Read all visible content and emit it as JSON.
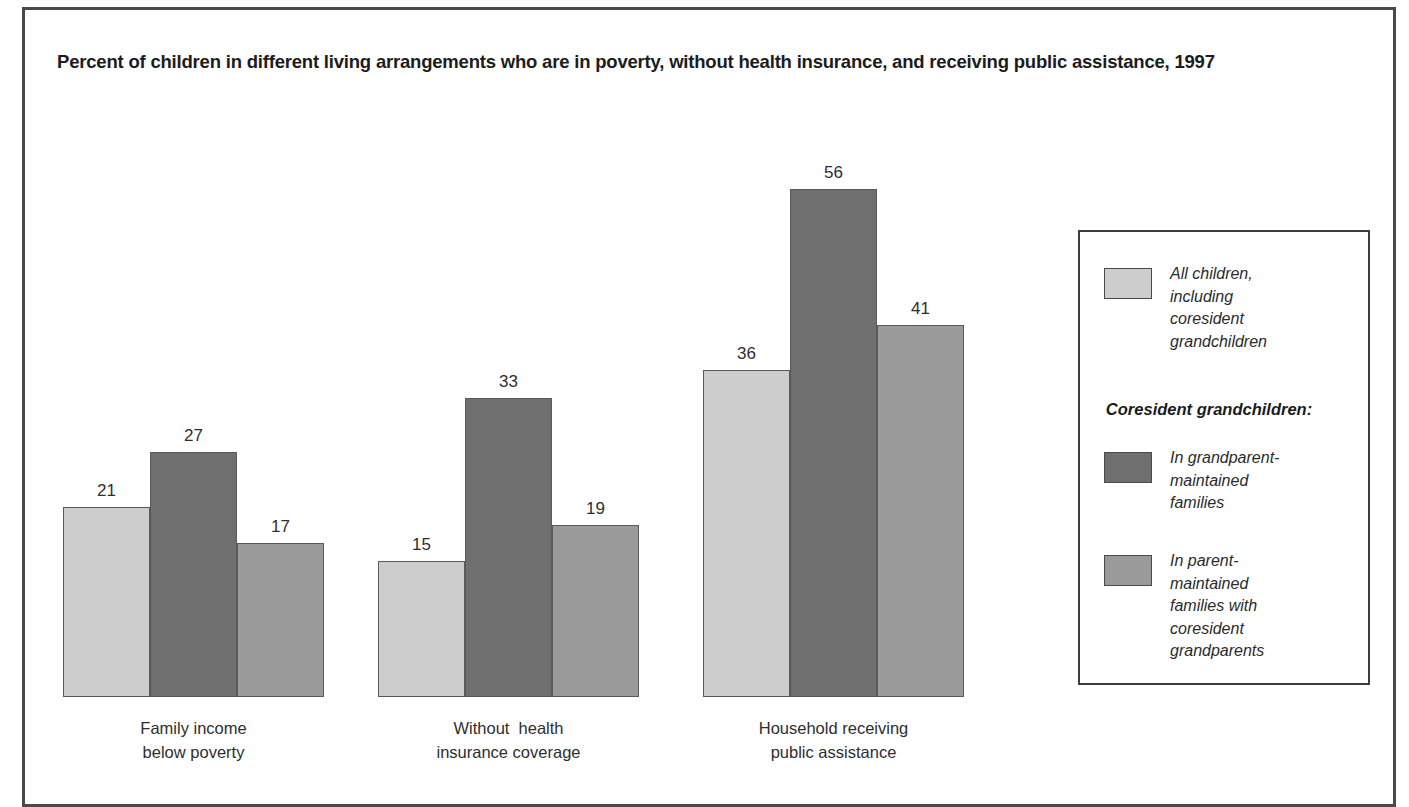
{
  "chart_data": {
    "type": "bar",
    "title": "Percent of children in different living arrangements who are in poverty, without health insurance, and receiving public assistance, 1997",
    "xlabel": "",
    "ylabel": "",
    "ylim": [
      0,
      60
    ],
    "grid": false,
    "legend_position": "right",
    "categories": [
      "Family income\nbelow poverty",
      "Without  health\ninsurance coverage",
      "Household receiving\npublic assistance"
    ],
    "series": [
      {
        "name": "All children, including coresident grandchildren",
        "color": "#cdcdcd",
        "values": [
          21,
          15,
          36
        ]
      },
      {
        "name": "In grandparent-maintained families",
        "color": "#6f6f6f",
        "values": [
          27,
          33,
          56
        ]
      },
      {
        "name": "In parent-maintained families with coresident grandparents",
        "color": "#9a9a9a",
        "values": [
          17,
          19,
          41
        ]
      }
    ]
  },
  "legend": {
    "subheading": "Coresident grandchildren:",
    "entries": [
      {
        "label": "All children,\nincluding\ncoresident\ngrandchildren",
        "color": "#cdcdcd"
      },
      {
        "label": "In grandparent-\nmaintained\nfamilies",
        "color": "#6f6f6f"
      },
      {
        "label": "In parent-\nmaintained\nfamilies with\ncoresident\ngrandparents",
        "color": "#9a9a9a"
      }
    ]
  }
}
